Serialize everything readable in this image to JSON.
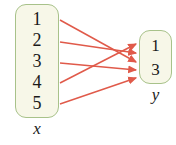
{
  "figure": {
    "type": "function-mapping-diagram",
    "background_color": "#ffffff"
  },
  "chart_data": {
    "type": "diagram",
    "title": "",
    "domain": {
      "label": "x",
      "elements": [
        "1",
        "2",
        "3",
        "4",
        "5"
      ]
    },
    "codomain": {
      "label": "y",
      "elements": [
        "1",
        "3"
      ]
    },
    "mappings": [
      {
        "from": "1",
        "to": "3"
      },
      {
        "from": "2",
        "to": "3"
      },
      {
        "from": "3",
        "to": "3"
      },
      {
        "from": "4",
        "to": "1"
      },
      {
        "from": "5",
        "to": "3"
      }
    ],
    "arrow_color": "#e05a4a",
    "box_fill_color": "#f7f7e8",
    "box_border_color": "#a8c28a"
  },
  "domain_set": {
    "label": "x",
    "items": [
      {
        "value": "1"
      },
      {
        "value": "2"
      },
      {
        "value": "3"
      },
      {
        "value": "4"
      },
      {
        "value": "5"
      }
    ]
  },
  "codomain_set": {
    "label": "y",
    "items": [
      {
        "value": "1"
      },
      {
        "value": "3"
      }
    ]
  },
  "arrows": [
    {
      "name": "arrow-from-1",
      "x1": 60,
      "y1": 20,
      "x2": 136,
      "y2": 62
    },
    {
      "name": "arrow-from-2",
      "x1": 60,
      "y1": 42,
      "x2": 136,
      "y2": 53
    },
    {
      "name": "arrow-from-3",
      "x1": 60,
      "y1": 63,
      "x2": 136,
      "y2": 70
    },
    {
      "name": "arrow-from-4",
      "x1": 60,
      "y1": 83,
      "x2": 136,
      "y2": 44
    },
    {
      "name": "arrow-from-5",
      "x1": 60,
      "y1": 104,
      "x2": 136,
      "y2": 78
    }
  ]
}
